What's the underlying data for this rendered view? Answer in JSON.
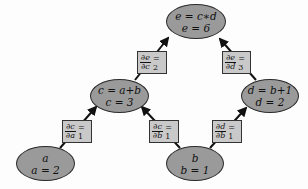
{
  "diagram": {
    "type": "computational-graph",
    "colors": {
      "node_fill": "#9a9a9a",
      "label_fill": "#c9c9c9",
      "stroke": "#1a1a1a",
      "background": "#fdfdfd"
    },
    "nodes": {
      "e": {
        "expr": "e = c∗d",
        "value": "e = 6"
      },
      "c": {
        "expr": "c = a+b",
        "value": "c = 3"
      },
      "d": {
        "expr": "d = b+1",
        "value": "d = 2"
      },
      "a": {
        "expr": "a",
        "value": "a = 2"
      },
      "b": {
        "expr": "b",
        "value": "b = 1"
      }
    },
    "edges": [
      {
        "from": "c",
        "to": "e",
        "num": "∂e",
        "den": "∂c",
        "value": "= 2"
      },
      {
        "from": "d",
        "to": "e",
        "num": "∂e",
        "den": "∂d",
        "value": "= 3"
      },
      {
        "from": "a",
        "to": "c",
        "num": "∂c",
        "den": "∂a",
        "value": "= 1"
      },
      {
        "from": "b",
        "to": "c",
        "num": "∂c",
        "den": "∂b",
        "value": "= 1"
      },
      {
        "from": "b",
        "to": "d",
        "num": "∂d",
        "den": "∂b",
        "value": "= 1"
      }
    ]
  }
}
